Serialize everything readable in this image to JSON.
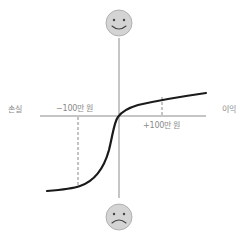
{
  "diagram": {
    "type": "value-function",
    "labels": {
      "loss": "손실",
      "gain": "이익",
      "minus_marker": "−100만 원",
      "plus_marker": "+100만 원"
    },
    "icons": {
      "top": "happy-face-icon",
      "bottom": "sad-face-icon"
    },
    "colors": {
      "axis": "#8c8c8c",
      "curve": "#1a1a1a",
      "face_fill": "#d4d4d4",
      "face_stroke": "#9a9a9a",
      "label": "#8a8a8a"
    }
  }
}
